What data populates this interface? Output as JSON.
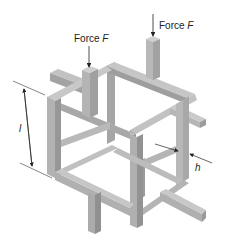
{
  "diagram": {
    "type": "3D lattice cube unit cell with protruding struts",
    "colors": {
      "background": "#ffffff",
      "strut_light": "#bdbdbd",
      "strut_mid": "#a8a8a8",
      "strut_dark": "#8f8f8f",
      "annotation": "#222222"
    },
    "labels": {
      "force_left": {
        "prefix": "Force ",
        "symbol": "F"
      },
      "force_right": {
        "prefix": "Force ",
        "symbol": "F"
      },
      "length": "l",
      "thickness": "h"
    },
    "annotations": [
      {
        "name": "force-arrow-left",
        "description": "downward arrow onto top-left vertical strut"
      },
      {
        "name": "force-arrow-right",
        "description": "downward arrow onto top-right vertical strut"
      },
      {
        "name": "length-dimension",
        "description": "cell edge length l on left side"
      },
      {
        "name": "thickness-dimension",
        "description": "strut thickness h on right side"
      }
    ]
  }
}
